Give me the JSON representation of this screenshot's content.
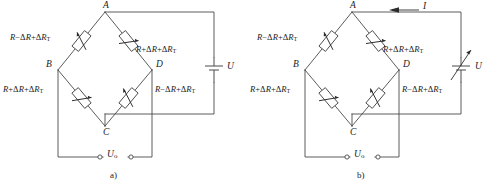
{
  "figure": {
    "line_color": "#4a4a4a",
    "text_color": "#1c1c1c",
    "background": "#ffffff"
  },
  "panels": [
    {
      "id": "a",
      "caption": "a)",
      "nodes": {
        "top": "A",
        "left": "B",
        "right": "D",
        "bottom": "C"
      },
      "resistors": [
        {
          "position": "top-left",
          "label_html": "<i>R</i>−Δ<i>R</i>+Δ<i>R</i><sub>T</sub>"
        },
        {
          "position": "top-right",
          "label_html": "<i>R</i>+Δ<i>R</i>+Δ<i>R</i><sub>T</sub>"
        },
        {
          "position": "bottom-left",
          "label_html": "<i>R</i>+Δ<i>R</i>+Δ<i>R</i><sub>T</sub>"
        },
        {
          "position": "bottom-right",
          "label_html": "<i>R</i>−Δ<i>R</i>+Δ<i>R</i><sub>T</sub>"
        }
      ],
      "source": {
        "label": "U",
        "type": "battery",
        "variable": false
      },
      "output": {
        "label_html": "<i>U</i><sub>o</sub>"
      },
      "current": null
    },
    {
      "id": "b",
      "caption": "b)",
      "nodes": {
        "top": "A",
        "left": "B",
        "right": "D",
        "bottom": "C"
      },
      "resistors": [
        {
          "position": "top-left",
          "label_html": "<i>R</i>−Δ<i>R</i>+Δ<i>R</i><sub>T</sub>"
        },
        {
          "position": "top-right",
          "label_html": "<i>R</i>+Δ<i>R</i>+Δ<i>R</i><sub>T</sub>"
        },
        {
          "position": "bottom-left",
          "label_html": "<i>R</i>+Δ<i>R</i>+Δ<i>R</i><sub>T</sub>"
        },
        {
          "position": "bottom-right",
          "label_html": "<i>R</i>−Δ<i>R</i>+Δ<i>R</i><sub>T</sub>"
        }
      ],
      "source": {
        "label": "U",
        "type": "battery",
        "variable": true
      },
      "output": {
        "label_html": "<i>U</i><sub>o</sub>"
      },
      "current": {
        "label": "I",
        "direction": "left"
      }
    }
  ]
}
